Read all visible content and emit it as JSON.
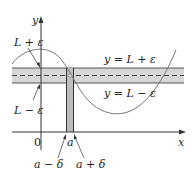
{
  "diagram": {
    "axes": {
      "x_label": "x",
      "y_label": "y",
      "origin_label": "0"
    },
    "horizontal_band": {
      "upper_label": "y = L + ε",
      "lower_label": "y = L − ε",
      "upper_value_label": "L + ε",
      "lower_value_label": "L − ε"
    },
    "vertical_band": {
      "center_label": "a",
      "left_label": "a − δ",
      "right_label": "a + δ"
    },
    "colors": {
      "band_fill": "#d6d6d6",
      "band_line": "#555555",
      "curve": "#777777",
      "axis": "#333333",
      "vertical_band_fill": "#bdbdbd"
    }
  }
}
